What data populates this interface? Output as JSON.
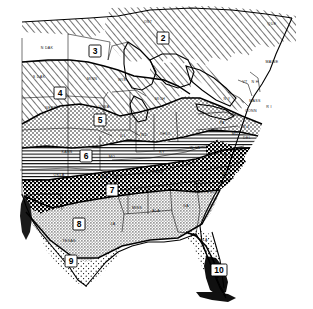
{
  "figure": {
    "kind": "map",
    "background_color": "#ffffff",
    "ink_color": "#000000",
    "width": 313,
    "height": 309
  },
  "zones": [
    {
      "id": "2",
      "label": "2",
      "x": 163,
      "y": 38,
      "pattern": "diagonal-hatch",
      "region": "southern Canada / Ontario"
    },
    {
      "id": "3",
      "label": "3",
      "x": 95,
      "y": 51,
      "pattern": "white",
      "region": "northern Minnesota / North Dakota border"
    },
    {
      "id": "4",
      "label": "4",
      "x": 60,
      "y": 93,
      "pattern": "diagonal-hatch",
      "region": "South Dakota / Wisconsin"
    },
    {
      "id": "5",
      "label": "5",
      "x": 100,
      "y": 120,
      "pattern": "stipple",
      "region": "Iowa / Nebraska"
    },
    {
      "id": "6",
      "label": "6",
      "x": 86,
      "y": 156,
      "pattern": "horizontal-line",
      "region": "Kansas / Missouri"
    },
    {
      "id": "7",
      "label": "7",
      "x": 112,
      "y": 190,
      "pattern": "checker",
      "region": "Oklahoma / Arkansas"
    },
    {
      "id": "8",
      "label": "8",
      "x": 79,
      "y": 224,
      "pattern": "gray-tone",
      "region": "Texas / Louisiana / Gulf states"
    },
    {
      "id": "9",
      "label": "9",
      "x": 71,
      "y": 261,
      "pattern": "light-stipple",
      "region": "south Texas"
    },
    {
      "id": "10",
      "label": "10",
      "x": 219,
      "y": 270,
      "pattern": "solid-dark",
      "region": "southern tip of Florida"
    }
  ],
  "states": [
    {
      "abbr": "N DAK",
      "x": 47,
      "y": 48
    },
    {
      "abbr": "S DAK",
      "x": 39,
      "y": 77
    },
    {
      "abbr": "NEBR",
      "x": 51,
      "y": 108
    },
    {
      "abbr": "MINN",
      "x": 92,
      "y": 79
    },
    {
      "abbr": "WIS",
      "x": 122,
      "y": 80
    },
    {
      "abbr": "MICH",
      "x": 160,
      "y": 99
    },
    {
      "abbr": "IOWA",
      "x": 104,
      "y": 107
    },
    {
      "abbr": "ILL",
      "x": 123,
      "y": 136
    },
    {
      "abbr": "IND",
      "x": 144,
      "y": 135
    },
    {
      "abbr": "OHIO",
      "x": 165,
      "y": 134
    },
    {
      "abbr": "KANS",
      "x": 67,
      "y": 152
    },
    {
      "abbr": "MO",
      "x": 112,
      "y": 157
    },
    {
      "abbr": "KY",
      "x": 162,
      "y": 152
    },
    {
      "abbr": "OKLA",
      "x": 59,
      "y": 175
    },
    {
      "abbr": "ARK",
      "x": 104,
      "y": 177
    },
    {
      "abbr": "TENN",
      "x": 158,
      "y": 172
    },
    {
      "abbr": "TEXAS",
      "x": 69,
      "y": 241
    },
    {
      "abbr": "LA",
      "x": 113,
      "y": 224
    },
    {
      "abbr": "MISS",
      "x": 137,
      "y": 208
    },
    {
      "abbr": "ALA",
      "x": 156,
      "y": 211
    },
    {
      "abbr": "GA",
      "x": 186,
      "y": 206
    },
    {
      "abbr": "FLA",
      "x": 204,
      "y": 240
    },
    {
      "abbr": "S C",
      "x": 210,
      "y": 192
    },
    {
      "abbr": "N C",
      "x": 226,
      "y": 173
    },
    {
      "abbr": "VA",
      "x": 225,
      "y": 155
    },
    {
      "abbr": "W VA",
      "x": 195,
      "y": 148
    },
    {
      "abbr": "PA",
      "x": 222,
      "y": 123
    },
    {
      "abbr": "N Y",
      "x": 227,
      "y": 99
    },
    {
      "abbr": "N J",
      "x": 246,
      "y": 127
    },
    {
      "abbr": "DEL",
      "x": 247,
      "y": 138
    },
    {
      "abbr": "MD",
      "x": 235,
      "y": 134
    },
    {
      "abbr": "MASS",
      "x": 255,
      "y": 101
    },
    {
      "abbr": "R I",
      "x": 269,
      "y": 107
    },
    {
      "abbr": "CONN",
      "x": 251,
      "y": 111
    },
    {
      "abbr": "VT",
      "x": 245,
      "y": 82
    },
    {
      "abbr": "N H",
      "x": 255,
      "y": 82
    },
    {
      "abbr": "MAINE",
      "x": 272,
      "y": 62
    },
    {
      "abbr": "ONT",
      "x": 148,
      "y": 22
    },
    {
      "abbr": "QUE",
      "x": 272,
      "y": 24
    }
  ],
  "legend_note": ""
}
